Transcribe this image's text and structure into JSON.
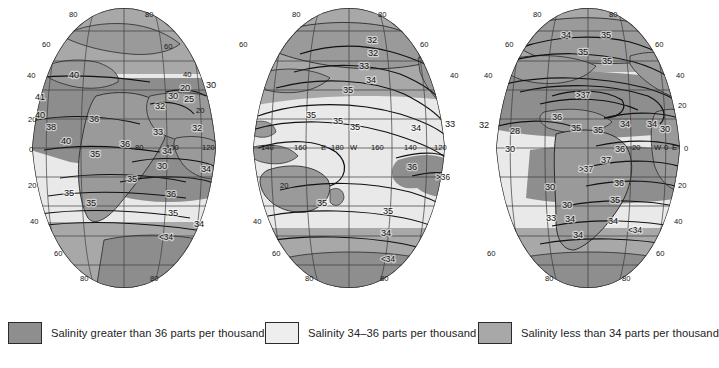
{
  "figure": {
    "type": "thematic-world-map",
    "projection": "interrupted-goode-homolosine",
    "background_color": "#ffffff"
  },
  "colors": {
    "high_salinity_fill": "#8e8e8e",
    "mid_salinity_fill": "#e9e9e9",
    "low_salinity_fill": "#a8a8a8",
    "land_fill": "#9a9a9a",
    "outline": "#2b2b2b",
    "graticule": "#3a3a3a",
    "contour": "#111111",
    "text": "#141414"
  },
  "legend": {
    "items": [
      {
        "swatch": "#8e8e8e",
        "label": "Salinity greater than 36 parts per thousand"
      },
      {
        "swatch": "#eeeeee",
        "label": "Salinity 34–36 parts per thousand"
      },
      {
        "swatch": "#a8a8a8",
        "label": "Salinity less than 34 parts per thousand"
      }
    ]
  },
  "graticule": {
    "latitude_labels": [
      "80",
      "60",
      "40",
      "20",
      "0",
      "20",
      "40",
      "60",
      "80"
    ],
    "latitude_interval_deg": 20,
    "longitude_interval_deg": 20,
    "lobes": [
      {
        "name": "lobe-left",
        "top_labels": [
          "80",
          "80"
        ],
        "side_labels": [
          "60",
          "40",
          "20",
          "0",
          "20",
          "40",
          "60"
        ],
        "bottom_labels": [
          "80",
          "80"
        ],
        "equator_longitude_labels": [
          "80",
          "100",
          "120"
        ]
      },
      {
        "name": "lobe-center",
        "top_labels": [
          "80",
          "80"
        ],
        "side_labels": [
          "60",
          "40",
          "20",
          "20",
          "40",
          "60"
        ],
        "bottom_labels": [
          "80",
          "80"
        ],
        "equator_longitude_labels": [
          "140",
          "160",
          "E",
          "180",
          "W",
          "160",
          "140",
          "120"
        ]
      },
      {
        "name": "lobe-right",
        "top_labels": [
          "80",
          "80"
        ],
        "side_labels": [
          "60",
          "40",
          "20",
          "0",
          "20",
          "40",
          "60"
        ],
        "bottom_labels": [
          "80",
          "80"
        ],
        "equator_longitude_labels": [
          "20",
          "W",
          "0",
          "E"
        ]
      }
    ]
  },
  "chart_data": {
    "type": "map",
    "title": "",
    "value_unit": "parts per thousand",
    "classes": [
      {
        "name": "high",
        "range": "> 36",
        "fill": "#8e8e8e"
      },
      {
        "name": "mid",
        "range": "34–36",
        "fill": "#eeeeee"
      },
      {
        "name": "low",
        "range": "< 34",
        "fill": "#a8a8a8"
      }
    ],
    "contour_labels": [
      {
        "lobe": "lobe-left",
        "value": "40",
        "x": 74,
        "y": 78
      },
      {
        "lobe": "lobe-left",
        "value": "41",
        "x": 40,
        "y": 100
      },
      {
        "lobe": "lobe-left",
        "value": "40",
        "x": 40,
        "y": 118
      },
      {
        "lobe": "lobe-left",
        "value": "38",
        "x": 51,
        "y": 130
      },
      {
        "lobe": "lobe-left",
        "value": "36",
        "x": 94,
        "y": 122
      },
      {
        "lobe": "lobe-left",
        "value": "40",
        "x": 66,
        "y": 144
      },
      {
        "lobe": "lobe-left",
        "value": "35",
        "x": 95,
        "y": 157
      },
      {
        "lobe": "lobe-left",
        "value": "36",
        "x": 125,
        "y": 147
      },
      {
        "lobe": "lobe-left",
        "value": "33",
        "x": 158,
        "y": 135
      },
      {
        "lobe": "lobe-left",
        "value": "34",
        "x": 167,
        "y": 154
      },
      {
        "lobe": "lobe-left",
        "value": "30",
        "x": 162,
        "y": 169
      },
      {
        "lobe": "lobe-left",
        "value": "34",
        "x": 206,
        "y": 172
      },
      {
        "lobe": "lobe-left",
        "value": "35",
        "x": 132,
        "y": 182
      },
      {
        "lobe": "lobe-left",
        "value": "35",
        "x": 69,
        "y": 196
      },
      {
        "lobe": "lobe-left",
        "value": "36",
        "x": 171,
        "y": 197
      },
      {
        "lobe": "lobe-left",
        "value": "35",
        "x": 91,
        "y": 206
      },
      {
        "lobe": "lobe-left",
        "value": "35",
        "x": 173,
        "y": 216
      },
      {
        "lobe": "lobe-left",
        "value": "34",
        "x": 199,
        "y": 227
      },
      {
        "lobe": "lobe-left",
        "value": "<34",
        "x": 166,
        "y": 240
      },
      {
        "lobe": "lobe-left",
        "value": "32",
        "x": 160,
        "y": 109
      },
      {
        "lobe": "lobe-left",
        "value": "30",
        "x": 173,
        "y": 99
      },
      {
        "lobe": "lobe-left",
        "value": "20",
        "x": 185,
        "y": 91
      },
      {
        "lobe": "lobe-left",
        "value": "25",
        "x": 189,
        "y": 102
      },
      {
        "lobe": "lobe-left",
        "value": "30",
        "x": 211,
        "y": 88
      },
      {
        "lobe": "lobe-left",
        "value": "32",
        "x": 197,
        "y": 131
      },
      {
        "lobe": "lobe-center",
        "value": "32",
        "x": 372,
        "y": 43
      },
      {
        "lobe": "lobe-center",
        "value": "32",
        "x": 373,
        "y": 56
      },
      {
        "lobe": "lobe-center",
        "value": "33",
        "x": 364,
        "y": 69
      },
      {
        "lobe": "lobe-center",
        "value": "34",
        "x": 371,
        "y": 83
      },
      {
        "lobe": "lobe-center",
        "value": "35",
        "x": 348,
        "y": 93
      },
      {
        "lobe": "lobe-center",
        "value": "35",
        "x": 311,
        "y": 118
      },
      {
        "lobe": "lobe-center",
        "value": "35",
        "x": 338,
        "y": 124
      },
      {
        "lobe": "lobe-center",
        "value": "35",
        "x": 355,
        "y": 130
      },
      {
        "lobe": "lobe-center",
        "value": "34",
        "x": 416,
        "y": 131
      },
      {
        "lobe": "lobe-center",
        "value": "33",
        "x": 450,
        "y": 127
      },
      {
        "lobe": "lobe-center",
        "value": "36",
        "x": 412,
        "y": 170
      },
      {
        "lobe": "lobe-center",
        "value": ">36",
        "x": 443,
        "y": 180
      },
      {
        "lobe": "lobe-center",
        "value": "35",
        "x": 322,
        "y": 206
      },
      {
        "lobe": "lobe-center",
        "value": "35",
        "x": 388,
        "y": 214
      },
      {
        "lobe": "lobe-center",
        "value": "34",
        "x": 386,
        "y": 236
      },
      {
        "lobe": "lobe-center",
        "value": "<34",
        "x": 388,
        "y": 262
      },
      {
        "lobe": "lobe-right",
        "value": "34",
        "x": 566,
        "y": 38
      },
      {
        "lobe": "lobe-right",
        "value": "35",
        "x": 606,
        "y": 38
      },
      {
        "lobe": "lobe-right",
        "value": "35",
        "x": 583,
        "y": 55
      },
      {
        "lobe": "lobe-right",
        "value": "35",
        "x": 607,
        "y": 64
      },
      {
        "lobe": "lobe-right",
        "value": ">37",
        "x": 583,
        "y": 98
      },
      {
        "lobe": "lobe-right",
        "value": "36",
        "x": 557,
        "y": 120
      },
      {
        "lobe": "lobe-right",
        "value": "35",
        "x": 598,
        "y": 133
      },
      {
        "lobe": "lobe-right",
        "value": "35",
        "x": 576,
        "y": 131
      },
      {
        "lobe": "lobe-right",
        "value": "34",
        "x": 625,
        "y": 127
      },
      {
        "lobe": "lobe-right",
        "value": "34",
        "x": 652,
        "y": 127
      },
      {
        "lobe": "lobe-right",
        "value": "30",
        "x": 665,
        "y": 132
      },
      {
        "lobe": "lobe-right",
        "value": "28",
        "x": 515,
        "y": 134
      },
      {
        "lobe": "lobe-right",
        "value": "32",
        "x": 484,
        "y": 128
      },
      {
        "lobe": "lobe-right",
        "value": "30",
        "x": 510,
        "y": 152
      },
      {
        "lobe": "lobe-right",
        "value": "36",
        "x": 620,
        "y": 152
      },
      {
        "lobe": "lobe-right",
        "value": "37",
        "x": 606,
        "y": 163
      },
      {
        "lobe": "lobe-right",
        "value": ">37",
        "x": 586,
        "y": 172
      },
      {
        "lobe": "lobe-right",
        "value": "36",
        "x": 619,
        "y": 186
      },
      {
        "lobe": "lobe-right",
        "value": "30",
        "x": 550,
        "y": 190
      },
      {
        "lobe": "lobe-right",
        "value": "35",
        "x": 615,
        "y": 203
      },
      {
        "lobe": "lobe-right",
        "value": "30",
        "x": 567,
        "y": 208
      },
      {
        "lobe": "lobe-right",
        "value": "33",
        "x": 551,
        "y": 221
      },
      {
        "lobe": "lobe-right",
        "value": "34",
        "x": 570,
        "y": 222
      },
      {
        "lobe": "lobe-right",
        "value": "34",
        "x": 613,
        "y": 224
      },
      {
        "lobe": "lobe-right",
        "value": "<34",
        "x": 635,
        "y": 233
      },
      {
        "lobe": "lobe-right",
        "value": "34",
        "x": 578,
        "y": 238
      }
    ]
  }
}
